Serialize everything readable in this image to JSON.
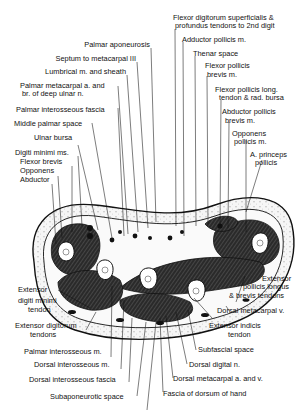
{
  "figure": {
    "labels_top_left": [
      {
        "id": "palmar-aponeurosis",
        "text": "Palmar aponeurosis"
      },
      {
        "id": "septum-metacarpal",
        "text": "Septum to metacarpal III"
      },
      {
        "id": "lumbrical",
        "text": "Lumbrical m. and sheath"
      },
      {
        "id": "palmar-metacarpal-a-1",
        "text": "Palmar metacarpal a. and"
      },
      {
        "id": "palmar-metacarpal-a-2",
        "text": "br. of deep ulnar n."
      },
      {
        "id": "palmar-interosseous-fascia",
        "text": "Palmar interosseous fascia"
      },
      {
        "id": "middle-palmar-space",
        "text": "Middle palmar space"
      },
      {
        "id": "ulnar-bursa",
        "text": "Ulnar bursa"
      },
      {
        "id": "digiti-minimi",
        "text": "Digiti minimi ms."
      },
      {
        "id": "flexor-brevis",
        "text": "Flexor brevis"
      },
      {
        "id": "opponens",
        "text": "Opponens"
      },
      {
        "id": "abductor",
        "text": "Abductor"
      }
    ],
    "labels_top_right": [
      {
        "id": "fds-1",
        "text": "Flexor digitorum superficialis &"
      },
      {
        "id": "fds-2",
        "text": "profundus tendons to 2nd digit"
      },
      {
        "id": "adductor-pollicis",
        "text": "Adductor pollicis m."
      },
      {
        "id": "thenar-space",
        "text": "Thenar space"
      },
      {
        "id": "fpb-1",
        "text": "Flexor pollicis"
      },
      {
        "id": "fpb-2",
        "text": "brevis m."
      },
      {
        "id": "fpl-1",
        "text": "Flexor pollicis long."
      },
      {
        "id": "fpl-2",
        "text": "tendon & rad. bursa"
      },
      {
        "id": "apb-1",
        "text": "Abductor pollicis"
      },
      {
        "id": "apb-2",
        "text": "brevis m."
      },
      {
        "id": "op-1",
        "text": "Opponens"
      },
      {
        "id": "op-2",
        "text": "pollicis m."
      },
      {
        "id": "apr-1",
        "text": "A. princeps"
      },
      {
        "id": "apr-2",
        "text": "pollicis"
      }
    ],
    "labels_bottom_left": [
      {
        "id": "edm-1",
        "text": "Extensor"
      },
      {
        "id": "edm-2",
        "text": "digiti minimi"
      },
      {
        "id": "edm-3",
        "text": "tendon"
      },
      {
        "id": "ed-1",
        "text": "Extensor digitorum"
      },
      {
        "id": "ed-2",
        "text": "tendons"
      },
      {
        "id": "palmar-interosseous-m",
        "text": "Palmar interosseous m."
      },
      {
        "id": "dorsal-interosseous-m",
        "text": "Dorsal interosseous m."
      },
      {
        "id": "dorsal-interosseous-fascia",
        "text": "Dorsal interosseous fascia"
      },
      {
        "id": "subaponeurotic-space",
        "text": "Subaponeurotic space"
      }
    ],
    "labels_bottom_right": [
      {
        "id": "epl-1",
        "text": "Extensor"
      },
      {
        "id": "epl-2",
        "text": "pollicis longus"
      },
      {
        "id": "epl-3",
        "text": "& brevis tendons"
      },
      {
        "id": "dorsal-metacarpal-v",
        "text": "Dorsal metacarpal v."
      },
      {
        "id": "eit-1",
        "text": "Extensor indicis"
      },
      {
        "id": "eit-2",
        "text": "tendon"
      },
      {
        "id": "subfascial-space",
        "text": "Subfascial space"
      },
      {
        "id": "dorsal-digital-n",
        "text": "Dorsal digital n."
      },
      {
        "id": "dorsal-metacarpal-av",
        "text": "Dorsal metacarpal a. and v."
      },
      {
        "id": "fascia-dorsum",
        "text": "Fascia of dorsum of hand"
      }
    ],
    "colors": {
      "ink": "#111111",
      "background": "#ffffff",
      "muscle": "#3a3a3a",
      "skin": "#f4f4f4"
    }
  }
}
